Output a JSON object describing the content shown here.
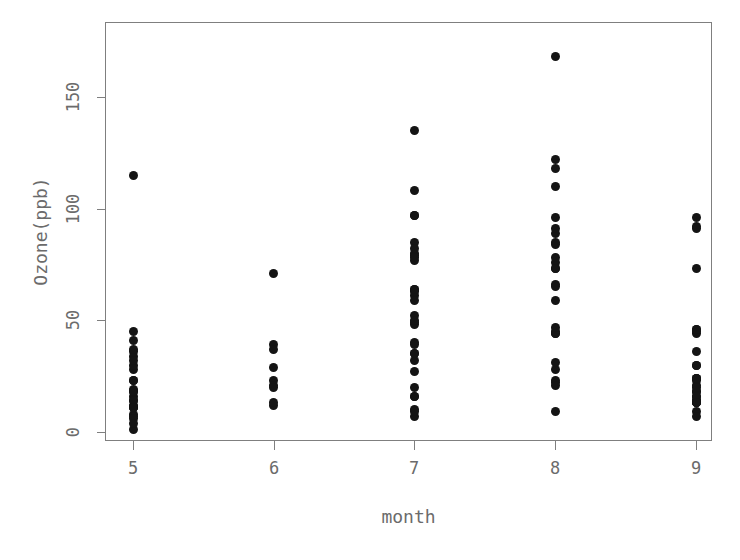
{
  "chart_data": {
    "type": "scatter",
    "title": "",
    "xlabel": "month",
    "ylabel": "Ozone(ppb)",
    "xlim": [
      4.5,
      9.5
    ],
    "ylim": [
      -5,
      175
    ],
    "grid": false,
    "legend": "none",
    "xticks": [
      5,
      6,
      7,
      8,
      9
    ],
    "xtick_labels": [
      "5",
      "6",
      "7",
      "8",
      "9"
    ],
    "yticks": [
      0,
      50,
      100,
      150
    ],
    "ytick_labels": [
      "0",
      "50",
      "100",
      "150"
    ],
    "marker": "filled-circle",
    "marker_color": "#141414",
    "marker_size_px": 9,
    "axis_color": "#7f7f7f",
    "text_color": "#6b6b6b",
    "background": "#ffffff",
    "series": [
      {
        "name": "Ozone",
        "x": [
          5,
          5,
          5,
          5,
          5,
          5,
          5,
          5,
          5,
          5,
          5,
          5,
          5,
          5,
          5,
          5,
          5,
          5,
          5,
          5,
          5,
          5,
          5,
          5,
          5,
          5,
          6,
          6,
          6,
          6,
          6,
          6,
          6,
          6,
          6,
          7,
          7,
          7,
          7,
          7,
          7,
          7,
          7,
          7,
          7,
          7,
          7,
          7,
          7,
          7,
          7,
          7,
          7,
          7,
          7,
          7,
          7,
          7,
          7,
          7,
          7,
          7,
          7,
          7,
          7,
          7,
          8,
          8,
          8,
          8,
          8,
          8,
          8,
          8,
          8,
          8,
          8,
          8,
          8,
          8,
          8,
          8,
          8,
          8,
          8,
          8,
          8,
          8,
          8,
          8,
          8,
          8,
          9,
          9,
          9,
          9,
          9,
          9,
          9,
          9,
          9,
          9,
          9,
          9,
          9,
          9,
          9,
          9,
          9,
          9,
          9,
          9,
          9,
          9,
          9,
          9,
          9,
          9,
          9,
          9,
          9
        ],
        "y": [
          41,
          36,
          12,
          18,
          28,
          23,
          19,
          8,
          7,
          16,
          11,
          14,
          18,
          14,
          34,
          6,
          30,
          11,
          1,
          11,
          4,
          32,
          23,
          45,
          115,
          37,
          29,
          71,
          39,
          23,
          21,
          37,
          20,
          12,
          13,
          135,
          49,
          32,
          64,
          40,
          77,
          97,
          97,
          85,
          10,
          27,
          7,
          48,
          35,
          61,
          79,
          63,
          16,
          80,
          108,
          20,
          52,
          82,
          50,
          64,
          59,
          39,
          9,
          16,
          78,
          35,
          66,
          122,
          89,
          110,
          44,
          28,
          65,
          22,
          59,
          23,
          31,
          44,
          21,
          9,
          45,
          168,
          73,
          76,
          118,
          84,
          85,
          96,
          78,
          73,
          91,
          47,
          44,
          21,
          9,
          45,
          13,
          24,
          46,
          18,
          13,
          24,
          16,
          13,
          23,
          36,
          7,
          14,
          30,
          14,
          18,
          20,
          16,
          30,
          13,
          24,
          46,
          73,
          91,
          96,
          92
        ]
      }
    ],
    "month_summaries": [
      {
        "month": 5,
        "n": 26,
        "min": 1,
        "max": 115,
        "note": "dense cluster 1-45 plus one outlier near 115"
      },
      {
        "month": 6,
        "n": 9,
        "min": 12,
        "max": 71,
        "note": "sparse, one point near 71"
      },
      {
        "month": 7,
        "n": 31,
        "min": 7,
        "max": 135,
        "note": "wide spread, top point near 135"
      },
      {
        "month": 8,
        "n": 26,
        "min": 9,
        "max": 168,
        "note": "highest point near 168"
      },
      {
        "month": 9,
        "n": 29,
        "min": 7,
        "max": 96,
        "note": "cluster under 50 plus a few near 73-96"
      }
    ]
  },
  "axes": {
    "xlabel": "month",
    "ylabel": "Ozone(ppb)"
  }
}
